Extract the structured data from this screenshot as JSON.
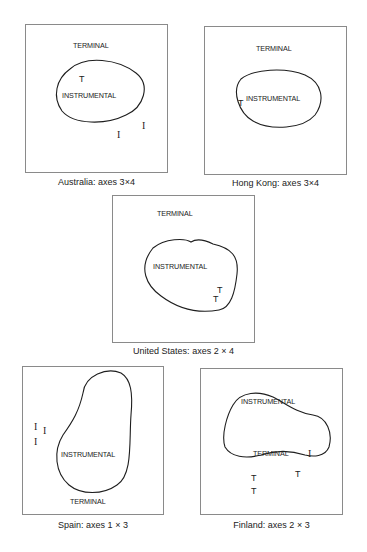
{
  "panels": [
    {
      "country": "Australia",
      "caption": "Australia: axes 3×4",
      "outer_label": "TERMINAL",
      "inner_label": "INSTRUMENTAL",
      "markers": [
        {
          "label": "T",
          "style": "sans"
        },
        {
          "label": "I",
          "style": "serif"
        },
        {
          "label": "I",
          "style": "serif"
        }
      ]
    },
    {
      "country": "Hong Kong",
      "caption": "Hong Kong: axes 3×4",
      "outer_label": "TERMINAL",
      "inner_label": "INSTRUMENTAL",
      "markers": [
        {
          "label": "T",
          "style": "sans"
        }
      ]
    },
    {
      "country": "United States",
      "caption": "United States: axes 2 × 4",
      "outer_label": "TERMINAL",
      "inner_label": "INSTRUMENTAL",
      "markers": [
        {
          "label": "T",
          "style": "sans"
        },
        {
          "label": "T",
          "style": "sans"
        }
      ]
    },
    {
      "country": "Spain",
      "caption": "Spain: axes 1 × 3",
      "outer_label": "TERMINAL",
      "inner_label": "INSTRUMENTAL",
      "markers": [
        {
          "label": "I",
          "style": "serif"
        },
        {
          "label": "I",
          "style": "serif"
        },
        {
          "label": "I",
          "style": "serif"
        }
      ]
    },
    {
      "country": "Finland",
      "caption": "Finland: axes 2 × 3",
      "outer_label": "INSTRUMENTAL",
      "inner_label": "TERMINAL",
      "markers": [
        {
          "label": "I",
          "style": "serif"
        },
        {
          "label": "T",
          "style": "sans"
        },
        {
          "label": "T",
          "style": "sans"
        },
        {
          "label": "T",
          "style": "sans"
        }
      ]
    }
  ]
}
